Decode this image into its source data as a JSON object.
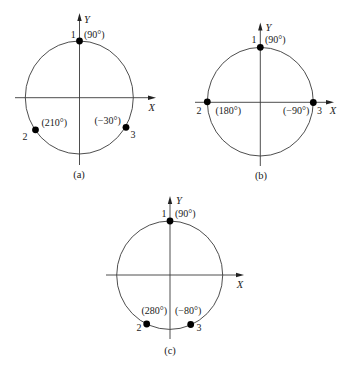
{
  "figure": {
    "panels": [
      {
        "id": "a",
        "caption": "(a)",
        "axis_x": "X",
        "axis_y": "Y",
        "points": [
          {
            "number": "1",
            "angle_label": "(90°)",
            "angle_deg": 90
          },
          {
            "number": "2",
            "angle_label": "(210°)",
            "angle_deg": 210
          },
          {
            "number": "3",
            "angle_label": "(−30°)",
            "angle_deg": -30
          }
        ]
      },
      {
        "id": "b",
        "caption": "(b)",
        "axis_x": "X",
        "axis_y": "Y",
        "points": [
          {
            "number": "1",
            "angle_label": "(90°)",
            "angle_deg": 90
          },
          {
            "number": "2",
            "angle_label": "(180°)",
            "angle_deg": 180
          },
          {
            "number": "3",
            "angle_label": "(−90°)",
            "angle_deg": -90
          }
        ]
      },
      {
        "id": "c",
        "caption": "(c)",
        "axis_x": "X",
        "axis_y": "Y",
        "points": [
          {
            "number": "1",
            "angle_label": "(90°)",
            "angle_deg": 90
          },
          {
            "number": "2",
            "angle_label": "(280°)",
            "angle_deg": 280
          },
          {
            "number": "3",
            "angle_label": "(−80°)",
            "angle_deg": -80
          }
        ]
      }
    ]
  }
}
